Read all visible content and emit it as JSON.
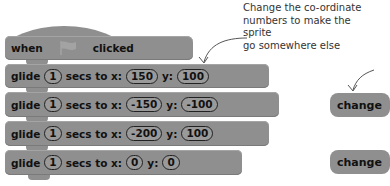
{
  "hat_block": {
    "when_label": "when",
    "icon": "green-flag-icon",
    "clicked_label": "clicked"
  },
  "glide_blocks": [
    {
      "label": "glide",
      "secs": "1",
      "secs_label": "secs to x:",
      "x": "150",
      "y_label": "y:",
      "y": "100"
    },
    {
      "label": "glide",
      "secs": "1",
      "secs_label": "secs to x:",
      "x": "-150",
      "y_label": "y:",
      "y": "-100"
    },
    {
      "label": "glide",
      "secs": "1",
      "secs_label": "secs to x:",
      "x": "-200",
      "y_label": "y:",
      "y": "100"
    },
    {
      "label": "glide",
      "secs": "1",
      "secs_label": "secs to x:",
      "x": "0",
      "y_label": "y:",
      "y": "0"
    }
  ],
  "annotation": {
    "line1": "Change the co-ordinate",
    "line2": "numbers to make the sprite",
    "line3": "go somewhere else"
  },
  "right_blocks": [
    {
      "label": "change"
    },
    {
      "label": "change"
    }
  ],
  "colors": {
    "block": "#8f8f8f",
    "text": "#111111",
    "annotation": "#333333"
  }
}
